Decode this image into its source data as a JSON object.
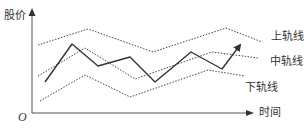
{
  "chart_data": {
    "type": "line",
    "title": "",
    "xlabel": "时间",
    "ylabel": "股价",
    "origin_label": "O",
    "grid": false,
    "legend": "inline labels on right",
    "series": [
      {
        "name": "上轨线",
        "style": "dotted",
        "points": [
          [
            38,
            45
          ],
          [
            88,
            29
          ],
          [
            153,
            52
          ],
          [
            226,
            28
          ],
          [
            262,
            42
          ]
        ]
      },
      {
        "name": "中轨线",
        "style": "dotted",
        "points": [
          [
            38,
            76
          ],
          [
            85,
            48
          ],
          [
            135,
            79
          ],
          [
            212,
            52
          ],
          [
            258,
            58
          ]
        ]
      },
      {
        "name": "下轨线",
        "style": "dotted",
        "points": [
          [
            40,
            101
          ],
          [
            85,
            75
          ],
          [
            130,
            97
          ],
          [
            208,
            70
          ],
          [
            245,
            76
          ]
        ]
      },
      {
        "name": "股价",
        "style": "solid",
        "points": [
          [
            45,
            82
          ],
          [
            72,
            44
          ],
          [
            98,
            66
          ],
          [
            130,
            57
          ],
          [
            155,
            82
          ],
          [
            191,
            52
          ],
          [
            222,
            69
          ],
          [
            240,
            45
          ]
        ],
        "arrow_end": true
      }
    ]
  },
  "labels": {
    "y_axis": "股价",
    "x_axis": "时间",
    "origin": "O",
    "upper": "上轨线",
    "middle": "中轨线",
    "lower": "下轨线"
  },
  "colors": {
    "line": "#333333",
    "band": "#444444",
    "axis": "#555555"
  }
}
